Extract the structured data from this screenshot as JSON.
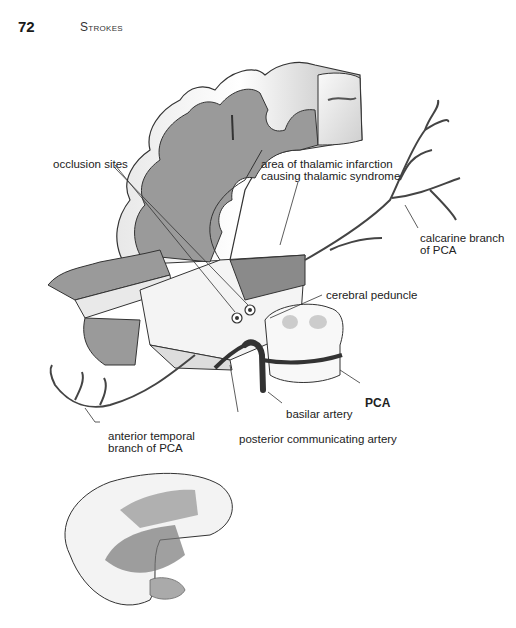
{
  "header": {
    "page_number": "72",
    "running_head": "Strokes"
  },
  "figure": {
    "labels": {
      "occlusion_sites": "occlusion sites",
      "thalamic_area_line1": "area of thalamic infarction",
      "thalamic_area_line2": "causing thalamic syndrome",
      "calcarine_line1": "calcarine branch",
      "calcarine_line2": "of PCA",
      "cerebral_peduncle": "cerebral peduncle",
      "pca": "PCA",
      "basilar_artery": "basilar artery",
      "anterior_temporal_line1": "anterior temporal",
      "anterior_temporal_line2": "branch of PCA",
      "posterior_communicating": "posterior communicating artery"
    },
    "colors": {
      "cortex_gray": "#9a9a9a",
      "white_matter": "#f2f2f2",
      "outline": "#333333",
      "artery": "#444444",
      "infarct_area": "#8a8a8a"
    }
  }
}
